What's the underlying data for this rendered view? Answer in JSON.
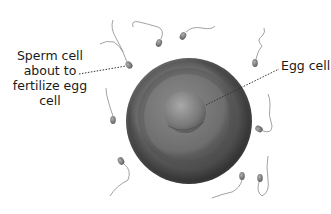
{
  "labels": {
    "sperm_line1": "Sperm cell",
    "sperm_line2": "about to",
    "sperm_line3": "fertilize egg",
    "sperm_line4": "cell",
    "egg": "Egg cell"
  },
  "colors": {
    "background": "#ffffff",
    "egg_outer_dark": "#3c3c3c",
    "egg_outer_mid": "#6a6a6a",
    "nucleus_light": "#9a9a9a",
    "sperm_head": "#7a7a7a",
    "tail": "#8a8a8a",
    "leader_line": "#333333",
    "text": "#1a1a1a"
  }
}
